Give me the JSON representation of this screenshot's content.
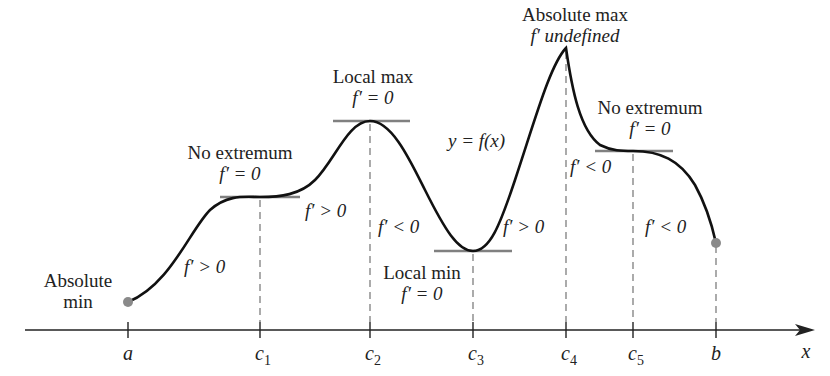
{
  "figure": {
    "curve_label": "y = f(x)",
    "x_axis_label": "x",
    "ticks": [
      {
        "name": "a",
        "base": "a",
        "sub": "",
        "x": 128
      },
      {
        "name": "c1",
        "base": "c",
        "sub": "1",
        "x": 260
      },
      {
        "name": "c2",
        "base": "c",
        "sub": "2",
        "x": 370
      },
      {
        "name": "c3",
        "base": "c",
        "sub": "3",
        "x": 473
      },
      {
        "name": "c4",
        "base": "c",
        "sub": "4",
        "x": 566
      },
      {
        "name": "c5",
        "base": "c",
        "sub": "5",
        "x": 633
      },
      {
        "name": "b",
        "base": "b",
        "sub": "",
        "x": 716
      }
    ],
    "annotations": {
      "abs_min": {
        "line1": "Absolute",
        "line2": "min"
      },
      "no_ext_1": {
        "line1": "No extremum",
        "line2": "f′ = 0"
      },
      "local_max": {
        "line1": "Local max",
        "line2": "f′ = 0"
      },
      "local_min": {
        "line1": "Local min",
        "line2": "f′ = 0"
      },
      "abs_max": {
        "line1": "Absolute max",
        "line2": "f′ undefined"
      },
      "no_ext_2": {
        "line1": "No extremum",
        "line2": "f′ = 0"
      }
    },
    "derivative_signs": {
      "a_c1": "f′ > 0",
      "c1_c2": "f′ > 0",
      "c2_c3": "f′ < 0",
      "c3_c4": "f′ > 0",
      "c4_c5": "f′ < 0",
      "c5_b": "f′ < 0"
    },
    "colors": {
      "curve": "#111111",
      "tangent": "#808080",
      "endpoint": "#8a8a8a",
      "dashed": "#666666",
      "axis": "#222222"
    }
  }
}
